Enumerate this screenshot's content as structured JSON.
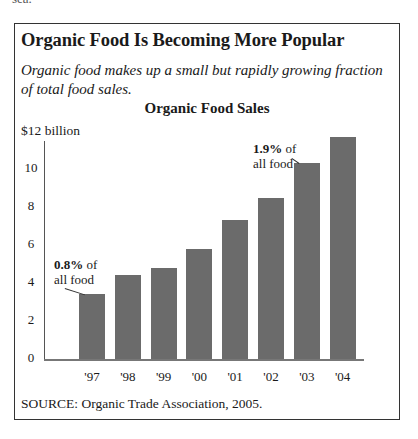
{
  "figure": {
    "top_clipped_text": "sea.",
    "title": "Organic Food Is Becoming More Popular",
    "subtitle": "Organic food makes up a small but rapidly growing fraction of total food sales.",
    "source": "SOURCE: Organic Trade Association, 2005."
  },
  "chart_data": {
    "type": "bar",
    "title": "Organic Food Sales",
    "xlabel": "",
    "ylabel": "$12 billion",
    "ylim": [
      0,
      12
    ],
    "yticks": [
      0,
      2,
      4,
      6,
      8,
      10
    ],
    "ytick_labels": [
      "0",
      "2",
      "4",
      "6",
      "8",
      "10"
    ],
    "y_top_label": "$12 billion",
    "grid": false,
    "categories": [
      "'97",
      "'98",
      "'99",
      "'00",
      "'01",
      "'02",
      "'03",
      "'04"
    ],
    "values": [
      3.4,
      4.4,
      4.8,
      5.8,
      7.3,
      8.5,
      10.3,
      11.7
    ],
    "bar_color": "#6b6b6b",
    "annotations": [
      {
        "category": "'97",
        "bold": "0.8%",
        "text1": " of",
        "text2": "all food"
      },
      {
        "category": "'03",
        "bold": "1.9%",
        "text1": " of",
        "text2": "all food"
      }
    ]
  }
}
